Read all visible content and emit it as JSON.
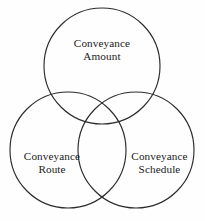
{
  "figure": {
    "type": "venn-diagram-3-set",
    "background_color": "#fefefe",
    "stroke_color": "#2b2b2b",
    "text_color": "#1a1a1a",
    "sets": [
      {
        "id": "amount",
        "position": "top",
        "label_line1": "Conveyance",
        "label_line2": "Amount",
        "cx": 102,
        "cy": 66,
        "r": 58
      },
      {
        "id": "route",
        "position": "bottom-left",
        "label_line1": "Conveyance",
        "label_line2": "Route",
        "cx": 68,
        "cy": 150,
        "r": 58
      },
      {
        "id": "schedule",
        "position": "bottom-right",
        "label_line1": "Conveyance",
        "label_line2": "Schedule",
        "cx": 136,
        "cy": 150,
        "r": 58
      }
    ]
  }
}
